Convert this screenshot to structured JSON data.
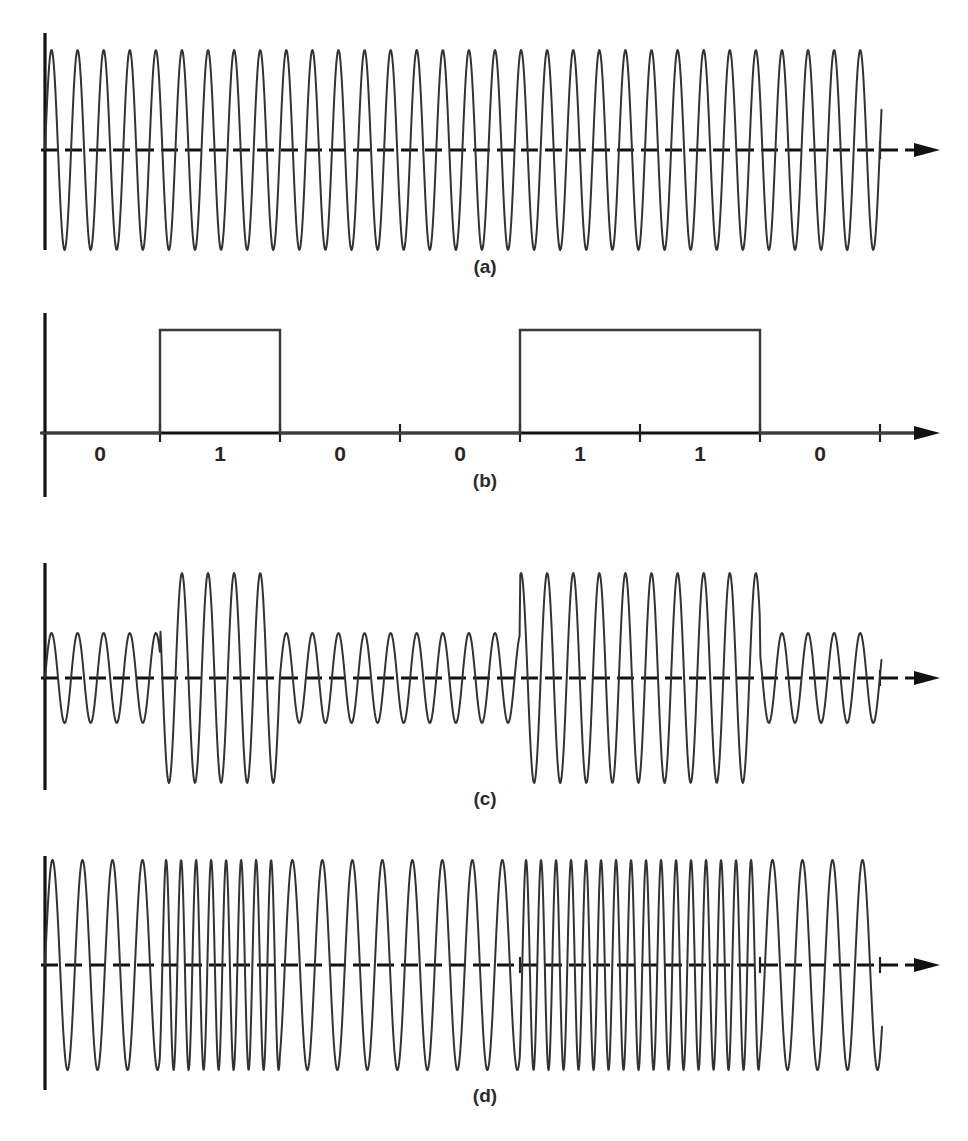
{
  "figure": {
    "background_color": "#ffffff",
    "stroke_color": "#333333",
    "axis_color": "#111111"
  },
  "panels": [
    {
      "id": "a",
      "label": "(a)",
      "name": "carrier-waveform",
      "description": "Unmodulated sinusoidal carrier",
      "modulation": "carrier"
    },
    {
      "id": "b",
      "label": "(b)",
      "name": "binary-data-waveform",
      "description": "Binary NRZ digital data stream",
      "modulation": "nrz"
    },
    {
      "id": "c",
      "label": "(c)",
      "name": "ask-waveform",
      "description": "Amplitude shift keying of the carrier",
      "modulation": "ask"
    },
    {
      "id": "d",
      "label": "(d)",
      "name": "fsk-waveform",
      "description": "Frequency shift keying of the carrier",
      "modulation": "fsk"
    }
  ],
  "bits": [
    "0",
    "1",
    "0",
    "0",
    "1",
    "1",
    "0"
  ],
  "chart_data": {
    "type": "line",
    "xlabel": "",
    "ylabel": "",
    "grid": false,
    "legend": "none",
    "bit_sequence": [
      0,
      1,
      0,
      0,
      1,
      1,
      0
    ],
    "bit_labels": [
      "0",
      "1",
      "0",
      "0",
      "1",
      "1",
      "0"
    ],
    "bit_count": 7,
    "bit_boundaries_px": [
      40,
      160,
      280,
      400,
      520,
      640,
      760,
      880
    ],
    "bit_duration_px": 120,
    "axis_origin_x_px": 45,
    "axis_end_x_px": 940,
    "panels": [
      {
        "id": "a",
        "label": "(a)",
        "type": "line",
        "series_name": "carrier",
        "waveform": "sine",
        "cycles_per_bit": 4.6,
        "total_cycles": 32,
        "amplitude_px": 100,
        "baseline_y_px": 150,
        "axis_top_y_px": 33,
        "axis_bottom_y_px": 250,
        "amplitude_constant": true,
        "frequency_constant": true
      },
      {
        "id": "b",
        "label": "(b)",
        "type": "line",
        "series_name": "binary data",
        "waveform": "nrz-rectangular",
        "high_level": 1,
        "low_level": 0,
        "values": [
          0,
          1,
          0,
          0,
          1,
          1,
          0
        ],
        "baseline_y_px": 433,
        "high_y_px": 330,
        "axis_top_y_px": 313,
        "axis_bottom_y_px": 497,
        "tick_marks_x_px": [
          40,
          160,
          280,
          400,
          520,
          640,
          760,
          880
        ]
      },
      {
        "id": "c",
        "label": "(c)",
        "type": "line",
        "series_name": "ASK",
        "waveform": "amplitude-shift-keyed sine",
        "cycles_per_bit": 4.6,
        "amplitude_for_zero_px": 45,
        "amplitude_for_one_px": 105,
        "baseline_y_px": 678,
        "axis_top_y_px": 563,
        "axis_bottom_y_px": 790,
        "amplitude_constant": false,
        "frequency_constant": true
      },
      {
        "id": "d",
        "label": "(d)",
        "type": "line",
        "series_name": "FSK",
        "waveform": "frequency-shift-keyed sine",
        "cycles_per_bit_zero": 4.0,
        "cycles_per_bit_one": 8.0,
        "amplitude_px": 105,
        "baseline_y_px": 965,
        "axis_top_y_px": 856,
        "axis_bottom_y_px": 1090,
        "amplitude_constant": true,
        "frequency_constant": false
      }
    ]
  }
}
